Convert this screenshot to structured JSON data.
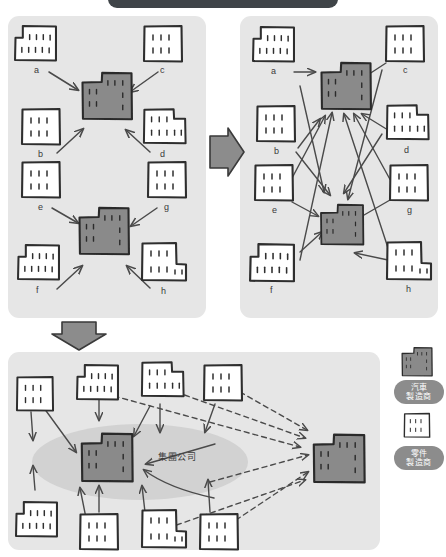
{
  "figure": {
    "title_banner": {
      "visible": true,
      "text": "",
      "color": "#3f4448"
    },
    "background": "#ffffff",
    "panel_fill": "#e6e6e6",
    "assembler_fill": "#8a8a8a",
    "supplier_fill": "#ffffff",
    "ink": "#3a3a3a",
    "flow_arrow_fill": "#8c8c8c",
    "group_ellipse_fill": "#d2d2d2"
  },
  "panels": {
    "top_left": {
      "name": "vertical-keiretsu-panel",
      "assemblers": [
        {
          "id": "A",
          "label": "A"
        },
        {
          "id": "B",
          "label": "B"
        }
      ],
      "suppliers": [
        {
          "id": "a",
          "label": "a"
        },
        {
          "id": "b",
          "label": "b"
        },
        {
          "id": "c",
          "label": "c"
        },
        {
          "id": "d",
          "label": "d"
        },
        {
          "id": "e",
          "label": "e"
        },
        {
          "id": "f",
          "label": "f"
        },
        {
          "id": "g",
          "label": "g"
        },
        {
          "id": "h",
          "label": "h"
        }
      ],
      "links": [
        {
          "from": "a",
          "to": "A",
          "style": "solid"
        },
        {
          "from": "b",
          "to": "A",
          "style": "solid"
        },
        {
          "from": "c",
          "to": "A",
          "style": "solid"
        },
        {
          "from": "d",
          "to": "A",
          "style": "solid"
        },
        {
          "from": "e",
          "to": "B",
          "style": "solid"
        },
        {
          "from": "f",
          "to": "B",
          "style": "solid"
        },
        {
          "from": "g",
          "to": "B",
          "style": "solid"
        },
        {
          "from": "h",
          "to": "B",
          "style": "solid"
        }
      ]
    },
    "top_right": {
      "name": "cross-supply-panel",
      "assemblers": [
        {
          "id": "A",
          "label": "A"
        },
        {
          "id": "B",
          "label": "B"
        }
      ],
      "suppliers": [
        {
          "id": "a",
          "label": "a"
        },
        {
          "id": "b",
          "label": "b"
        },
        {
          "id": "c",
          "label": "c"
        },
        {
          "id": "d",
          "label": "d"
        },
        {
          "id": "e",
          "label": "e"
        },
        {
          "id": "f",
          "label": "f"
        },
        {
          "id": "g",
          "label": "g"
        },
        {
          "id": "h",
          "label": "h"
        }
      ],
      "links": [
        {
          "from": "a",
          "to": "A",
          "style": "solid"
        },
        {
          "from": "b",
          "to": "A",
          "style": "solid"
        },
        {
          "from": "c",
          "to": "A",
          "style": "solid"
        },
        {
          "from": "d",
          "to": "A",
          "style": "solid"
        },
        {
          "from": "e",
          "to": "A",
          "style": "solid"
        },
        {
          "from": "f",
          "to": "A",
          "style": "solid"
        },
        {
          "from": "g",
          "to": "A",
          "style": "solid"
        },
        {
          "from": "h",
          "to": "A",
          "style": "solid"
        },
        {
          "from": "a",
          "to": "B",
          "style": "solid"
        },
        {
          "from": "b",
          "to": "B",
          "style": "solid"
        },
        {
          "from": "c",
          "to": "B",
          "style": "solid"
        },
        {
          "from": "d",
          "to": "B",
          "style": "solid"
        },
        {
          "from": "e",
          "to": "B",
          "style": "solid"
        },
        {
          "from": "f",
          "to": "B",
          "style": "solid"
        },
        {
          "from": "g",
          "to": "B",
          "style": "solid"
        },
        {
          "from": "h",
          "to": "B",
          "style": "solid"
        }
      ]
    },
    "bottom": {
      "name": "group-company-panel",
      "group_label": "集團公司",
      "assemblers": [
        {
          "id": "A",
          "label": "A",
          "inside_group": true
        },
        {
          "id": "B",
          "label": "B",
          "inside_group": false
        }
      ],
      "supplier_count": 8,
      "link_styles": [
        {
          "style": "solid",
          "meaning_to": "A"
        },
        {
          "style": "dashed",
          "meaning_to": "B"
        }
      ]
    }
  },
  "flow_arrows": [
    {
      "name": "arrow-left-to-right",
      "direction": "right"
    },
    {
      "name": "arrow-down-to-bottom",
      "direction": "down"
    }
  ],
  "legend": {
    "items": [
      {
        "icon": "dark-factory-icon",
        "line1": "汽車",
        "line2": "製造商",
        "swatch": "#8a8a8a"
      },
      {
        "icon": "white-factory-icon",
        "line1": "零件",
        "line2": "製造商",
        "swatch": "#ffffff"
      }
    ]
  }
}
